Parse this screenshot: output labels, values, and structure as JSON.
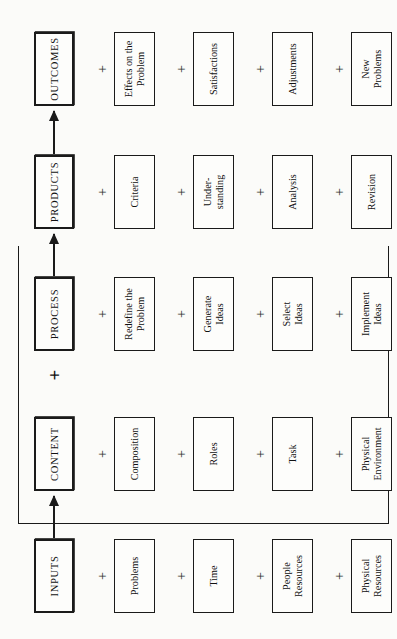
{
  "diagram": {
    "type": "flowchart",
    "orientation": "rotated-90-ccw",
    "separator": "+",
    "stages": [
      {
        "id": "inputs",
        "label": "INPUTS",
        "items": [
          "Problems",
          "Time",
          "People\nResources",
          "Physical\nResources"
        ]
      },
      {
        "id": "content",
        "label": "CONTENT",
        "items": [
          "Composition",
          "Roles",
          "Task",
          "Physical\nEnvironment"
        ]
      },
      {
        "id": "process",
        "label": "PROCESS",
        "items": [
          "Redefine the\nProblem",
          "Generate\nIdeas",
          "Select\nIdeas",
          "Implement\nIdeas"
        ]
      },
      {
        "id": "products",
        "label": "PRODUCTS",
        "items": [
          "Criteria",
          "Under-\nstanding",
          "Analysis",
          "Revision"
        ]
      },
      {
        "id": "outcomes",
        "label": "OUTCOMES",
        "items": [
          "Effects on the\nProblem",
          "Satisfactions",
          "Adjustments",
          "New\nProblems"
        ]
      }
    ],
    "content_process_connector": "+",
    "colors": {
      "ink": "#1a1a1a",
      "paper": "#fbfbf9"
    }
  }
}
